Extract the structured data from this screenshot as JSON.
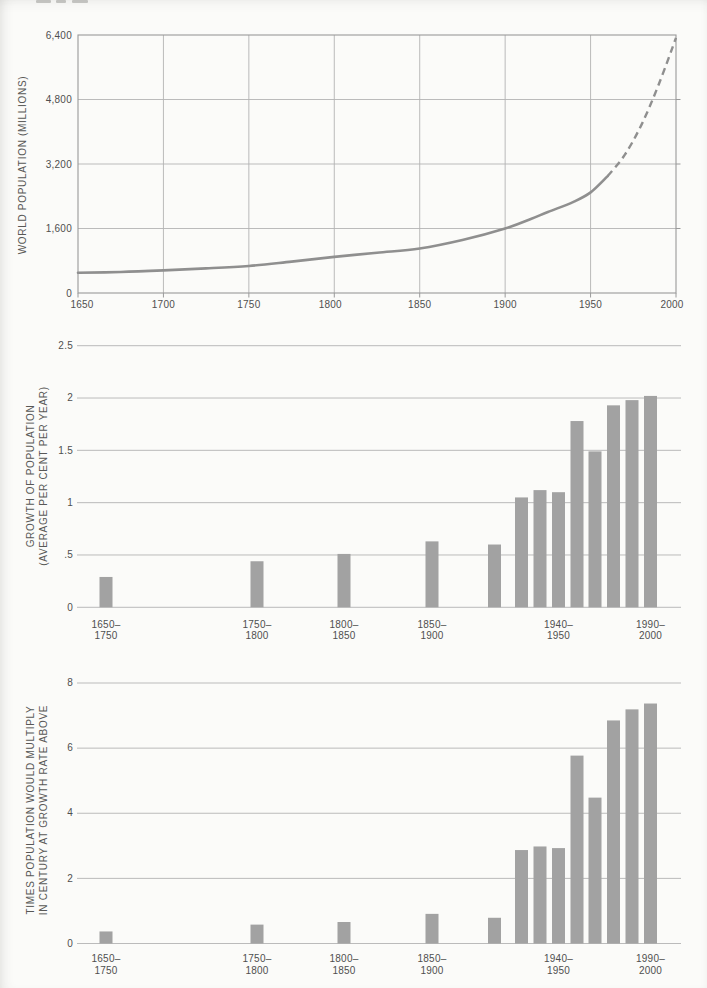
{
  "page_kind": "scanned statistics page with three stacked charts",
  "accent_colors": {
    "bar_fill": "#a2a2a2",
    "line_stroke": "#8f8f8f",
    "grid": "#b3b3b3",
    "frame": "#9a9a9a",
    "text": "#4f4f4f"
  },
  "chart_data": [
    {
      "type": "line",
      "title": "",
      "xlabel": "",
      "ylabel": "WORLD POPULATION (MILLIONS)",
      "xlim": [
        1650,
        2000
      ],
      "ylim": [
        0,
        6400
      ],
      "grid": true,
      "y_ticks": [
        {
          "label": "6,400",
          "value": 6400
        },
        {
          "label": "4,800",
          "value": 4800
        },
        {
          "label": "3,200",
          "value": 3200
        },
        {
          "label": "1,600",
          "value": 1600
        },
        {
          "label": "0",
          "value": 0
        }
      ],
      "x_ticks": [
        {
          "label": "1650",
          "value": 1650
        },
        {
          "label": "1700",
          "value": 1700
        },
        {
          "label": "1750",
          "value": 1750
        },
        {
          "label": "1800",
          "value": 1800
        },
        {
          "label": "1850",
          "value": 1850
        },
        {
          "label": "1900",
          "value": 1900
        },
        {
          "label": "1950",
          "value": 1950
        },
        {
          "label": "2000",
          "value": 2000
        }
      ],
      "series": [
        {
          "name": "world-population-millions",
          "style": "solid then dashed (projection)",
          "projection_from_year": 1960,
          "points": [
            [
              1650,
              500
            ],
            [
              1675,
              520
            ],
            [
              1700,
              560
            ],
            [
              1725,
              610
            ],
            [
              1750,
              670
            ],
            [
              1775,
              780
            ],
            [
              1800,
              895
            ],
            [
              1825,
              1000
            ],
            [
              1850,
              1105
            ],
            [
              1875,
              1315
            ],
            [
              1900,
              1600
            ],
            [
              1915,
              1835
            ],
            [
              1925,
              2010
            ],
            [
              1940,
              2260
            ],
            [
              1950,
              2495
            ],
            [
              1960,
              2900
            ],
            [
              1970,
              3425
            ],
            [
              1980,
              4190
            ],
            [
              1990,
              5185
            ],
            [
              2000,
              6330
            ]
          ]
        }
      ]
    },
    {
      "type": "bar",
      "title": "",
      "xlabel": "",
      "ylabel_lines": [
        "GROWTH OF POPULATION",
        "(AVERAGE PER CENT PER YEAR)"
      ],
      "ylim": [
        0,
        2.5
      ],
      "grid": true,
      "y_ticks": [
        {
          "label": "2.5",
          "value": 2.5
        },
        {
          "label": "2",
          "value": 2
        },
        {
          "label": "1.5",
          "value": 1.5
        },
        {
          "label": "1",
          "value": 1
        },
        {
          "label": ".5",
          "value": 0.5
        },
        {
          "label": "0",
          "value": 0
        }
      ],
      "categories": [
        "1650–1750",
        "1750–1800",
        "1800–1850",
        "1850–1900",
        "1900–1920",
        "1920–1930",
        "1930–1940",
        "1940–1950",
        "1950–1960",
        "1960–1970",
        "1970–1980",
        "1980–1990",
        "1990–2000"
      ],
      "values": [
        0.29,
        0.44,
        0.51,
        0.63,
        0.6,
        1.05,
        1.12,
        1.1,
        1.78,
        1.49,
        1.93,
        1.98,
        2.02
      ],
      "x_tick_labels": [
        {
          "index": 0,
          "lines": [
            "1650–",
            "1750"
          ]
        },
        {
          "index": 1,
          "lines": [
            "1750–",
            "1800"
          ]
        },
        {
          "index": 2,
          "lines": [
            "1800–",
            "1850"
          ]
        },
        {
          "index": 3,
          "lines": [
            "1850–",
            "1900"
          ]
        },
        {
          "index": 7,
          "lines": [
            "1940–",
            "1950"
          ]
        },
        {
          "index": 12,
          "lines": [
            "1990–",
            "2000"
          ]
        }
      ]
    },
    {
      "type": "bar",
      "title": "",
      "xlabel": "",
      "ylabel_lines": [
        "TIMES POPULATION WOULD MULTIPLY",
        "IN CENTURY AT GROWTH RATE ABOVE"
      ],
      "ylim": [
        0,
        8
      ],
      "grid": true,
      "y_ticks": [
        {
          "label": "8",
          "value": 8
        },
        {
          "label": "6",
          "value": 6
        },
        {
          "label": "4",
          "value": 4
        },
        {
          "label": "2",
          "value": 2
        },
        {
          "label": "0",
          "value": 0
        }
      ],
      "categories": [
        "1650–1750",
        "1750–1800",
        "1800–1850",
        "1850–1900",
        "1900–1920",
        "1920–1930",
        "1930–1940",
        "1940–1950",
        "1950–1960",
        "1960–1970",
        "1970–1980",
        "1980–1990",
        "1990–2000"
      ],
      "values": [
        0.37,
        0.58,
        0.66,
        0.91,
        0.79,
        2.87,
        2.98,
        2.93,
        5.77,
        4.48,
        6.85,
        7.19,
        7.37
      ],
      "x_tick_labels": [
        {
          "index": 0,
          "lines": [
            "1650–",
            "1750"
          ]
        },
        {
          "index": 1,
          "lines": [
            "1750–",
            "1800"
          ]
        },
        {
          "index": 2,
          "lines": [
            "1800–",
            "1850"
          ]
        },
        {
          "index": 3,
          "lines": [
            "1850–",
            "1900"
          ]
        },
        {
          "index": 7,
          "lines": [
            "1940–",
            "1950"
          ]
        },
        {
          "index": 12,
          "lines": [
            "1990–",
            "2000"
          ]
        }
      ]
    }
  ]
}
